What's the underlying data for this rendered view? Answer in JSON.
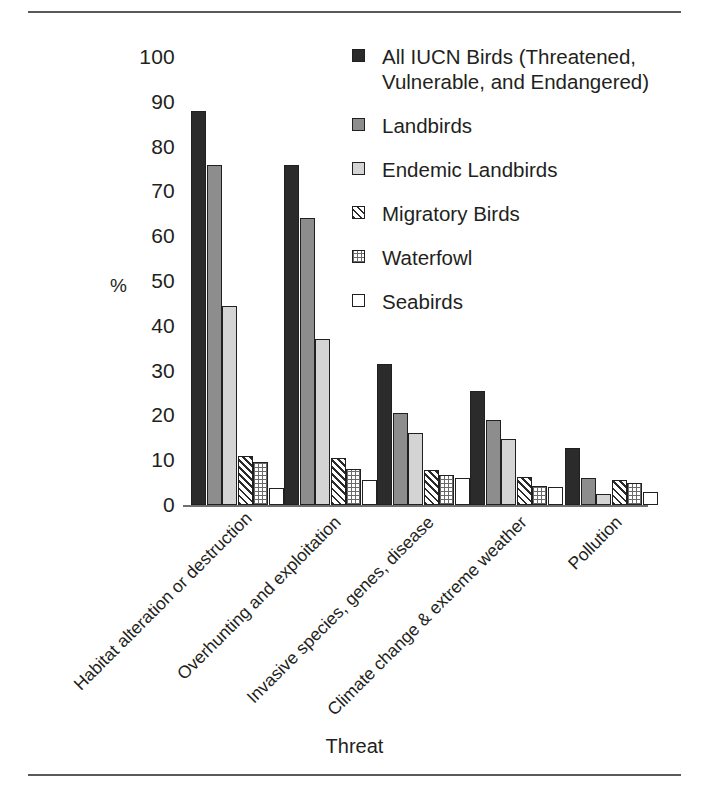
{
  "chart_data": {
    "type": "bar",
    "title": "",
    "xlabel": "Threat",
    "ylabel": "%",
    "ylim": [
      0,
      100
    ],
    "ytick_step": 10,
    "yticks": [
      "100",
      "90",
      "80",
      "70",
      "60",
      "50",
      "40",
      "30",
      "20",
      "10",
      "0"
    ],
    "grid": false,
    "legend_position": "top-right",
    "categories": [
      "Habitat alteration or destruction",
      "Overhunting and exploitation",
      "Invasive species, genes, disease",
      "Climate change & extreme weather",
      "Pollution"
    ],
    "series": [
      {
        "name": "All IUCN Birds (Threatened, Vulnerable, and Endangered)",
        "pattern": "solid-dark",
        "color": "#2b2b2b",
        "values": [
          88,
          76,
          31.5,
          25.5,
          12.7
        ]
      },
      {
        "name": "Landbirds",
        "pattern": "solid-mid-gray",
        "color": "#8d8d8d",
        "values": [
          76,
          64,
          20.5,
          19,
          6
        ]
      },
      {
        "name": "Endemic Landbirds",
        "pattern": "solid-light-gray",
        "color": "#d4d4d4",
        "values": [
          44.5,
          37,
          16,
          14.7,
          2.5
        ]
      },
      {
        "name": "Migratory Birds",
        "pattern": "diagonal-hatch",
        "color": "#ffffff",
        "values": [
          11,
          10.5,
          7.8,
          6.2,
          5.5
        ]
      },
      {
        "name": "Waterfowl",
        "pattern": "dotted-grid",
        "color": "#ffffff",
        "values": [
          9.5,
          8,
          6.7,
          4.3,
          5
        ]
      },
      {
        "name": "Seabirds",
        "pattern": "open-white",
        "color": "#ffffff",
        "values": [
          3.8,
          5.5,
          6,
          4,
          3
        ]
      }
    ]
  },
  "legend": {
    "items": [
      {
        "label": "All IUCN Birds (Threatened, Vulnerable, and Endangered)",
        "pattern": "solid-dark"
      },
      {
        "label": "Landbirds",
        "pattern": "solid-mid-gray"
      },
      {
        "label": "Endemic Landbirds",
        "pattern": "solid-light-gray"
      },
      {
        "label": "Migratory Birds",
        "pattern": "diagonal-hatch"
      },
      {
        "label": "Waterfowl",
        "pattern": "dotted-grid"
      },
      {
        "label": "Seabirds",
        "pattern": "open-white"
      }
    ]
  }
}
